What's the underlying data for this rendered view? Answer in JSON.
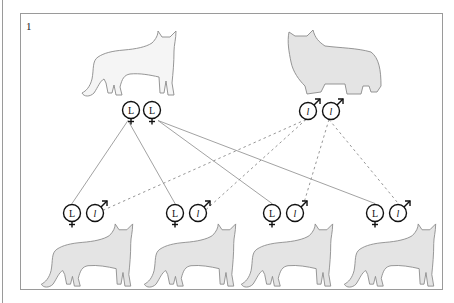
{
  "panel": {
    "label": "1"
  },
  "colors": {
    "cat_fill_shorthair_parent": "#f5f5f5",
    "cat_fill": "#e4e4e4",
    "cat_stroke": "#8a8a8a",
    "symbol_stroke": "#111111",
    "line_color": "#8a8a8a"
  },
  "parents": [
    {
      "id": "mother",
      "coat": "short-hair",
      "sex": "female",
      "alleles": [
        "L",
        "L"
      ]
    },
    {
      "id": "father",
      "coat": "long-hair",
      "sex": "male",
      "alleles": [
        "l",
        "l"
      ]
    }
  ],
  "offspring": [
    {
      "id": "kitten-1",
      "coat": "short-hair",
      "alleles": [
        {
          "symbol": "L",
          "from": "mother"
        },
        {
          "symbol": "l",
          "from": "father"
        }
      ]
    },
    {
      "id": "kitten-2",
      "coat": "short-hair",
      "alleles": [
        {
          "symbol": "L",
          "from": "mother"
        },
        {
          "symbol": "l",
          "from": "father"
        }
      ]
    },
    {
      "id": "kitten-3",
      "coat": "short-hair",
      "alleles": [
        {
          "symbol": "L",
          "from": "mother"
        },
        {
          "symbol": "l",
          "from": "father"
        }
      ]
    },
    {
      "id": "kitten-4",
      "coat": "short-hair",
      "alleles": [
        {
          "symbol": "L",
          "from": "mother"
        },
        {
          "symbol": "l",
          "from": "father"
        }
      ]
    }
  ],
  "connections": {
    "maternal_style": "solid",
    "paternal_style": "dashed"
  }
}
